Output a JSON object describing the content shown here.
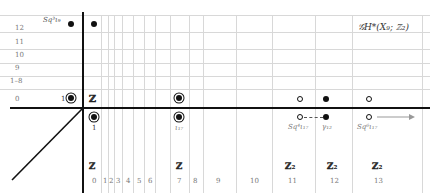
{
  "title": "𝒢H*(X₉; ℤ₂)",
  "row_labels": [
    "12",
    "11",
    "10",
    "9",
    "1–8",
    "0"
  ],
  "column_labels": [
    "0",
    "1",
    "2",
    "3",
    "4",
    "5",
    "6",
    "7",
    "8",
    "9",
    "10",
    "11",
    "12",
    "13"
  ],
  "group_labels": {
    "c0": "ℤ",
    "c7": "ℤ",
    "c11": "ℤ₂",
    "c12": "ℤ₂",
    "c13": "ℤ₂"
  },
  "origin_label": "ℤ",
  "generators": {
    "one_left": "1",
    "one_below": "1",
    "iota17": "ι₁₇",
    "sq3": "Sq³ι₉",
    "sq4": "Sq⁴ι₁₇",
    "gamma": "γ₁₂",
    "sq6": "Sq⁶ι₁₇"
  },
  "colors": {
    "grid": "#d8d8d8",
    "axis": "#111111",
    "arrow": "#999999"
  }
}
